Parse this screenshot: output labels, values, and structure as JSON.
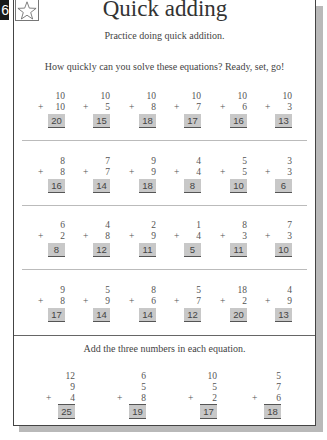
{
  "page": {
    "number": "6",
    "star_icon": "star-outline-icon",
    "title": "Quick adding",
    "subtitle": "Practice doing quick addition.",
    "instruction": "How quickly can you solve these equations? Ready, set, go!",
    "instruction2": "Add the three numbers in each equation."
  },
  "rows": [
    [
      {
        "a": "10",
        "b": "10",
        "ans": "20"
      },
      {
        "a": "10",
        "b": "5",
        "ans": "15"
      },
      {
        "a": "10",
        "b": "8",
        "ans": "18"
      },
      {
        "a": "10",
        "b": "7",
        "ans": "17"
      },
      {
        "a": "10",
        "b": "6",
        "ans": "16"
      },
      {
        "a": "10",
        "b": "3",
        "ans": "13"
      }
    ],
    [
      {
        "a": "8",
        "b": "8",
        "ans": "16"
      },
      {
        "a": "7",
        "b": "7",
        "ans": "14"
      },
      {
        "a": "9",
        "b": "9",
        "ans": "18"
      },
      {
        "a": "4",
        "b": "4",
        "ans": "8"
      },
      {
        "a": "5",
        "b": "5",
        "ans": "10"
      },
      {
        "a": "3",
        "b": "3",
        "ans": "6"
      }
    ],
    [
      {
        "a": "6",
        "b": "2",
        "ans": "8"
      },
      {
        "a": "4",
        "b": "8",
        "ans": "12"
      },
      {
        "a": "2",
        "b": "9",
        "ans": "11"
      },
      {
        "a": "1",
        "b": "4",
        "ans": "5"
      },
      {
        "a": "8",
        "b": "3",
        "ans": "11"
      },
      {
        "a": "7",
        "b": "3",
        "ans": "10"
      }
    ],
    [
      {
        "a": "9",
        "b": "8",
        "ans": "17"
      },
      {
        "a": "5",
        "b": "9",
        "ans": "14"
      },
      {
        "a": "8",
        "b": "6",
        "ans": "14"
      },
      {
        "a": "5",
        "b": "7",
        "ans": "12"
      },
      {
        "a": "18",
        "b": "2",
        "ans": "20"
      },
      {
        "a": "4",
        "b": "9",
        "ans": "13"
      }
    ]
  ],
  "three": [
    {
      "a": "12",
      "b": "9",
      "c": "4",
      "ans": "25"
    },
    {
      "a": "6",
      "b": "5",
      "c": "8",
      "ans": "19"
    },
    {
      "a": "10",
      "b": "5",
      "c": "2",
      "ans": "17"
    },
    {
      "a": "5",
      "b": "7",
      "c": "6",
      "ans": "18"
    }
  ],
  "plus_sign": "+"
}
